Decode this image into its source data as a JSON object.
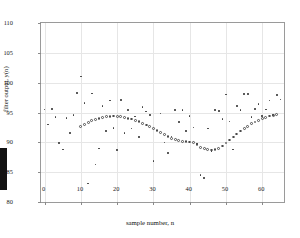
{
  "figure": {
    "background": "#ffffff",
    "frame_color": "#9a9a9a",
    "grid_color": "#e6e6e6",
    "marker_color": "#3a3a3a"
  },
  "axes": {
    "x_title": "sample number, n",
    "y_title": "filter output, y(n)",
    "x_ticks": [
      "0",
      "10",
      "20",
      "30",
      "40",
      "50",
      "60"
    ],
    "y_ticks": [
      "80",
      "85",
      "90",
      "95",
      "100",
      "105",
      "110"
    ]
  },
  "chart_data": {
    "type": "scatter",
    "title": "",
    "xlabel": "sample number, n",
    "ylabel": "filter output, y(n)",
    "xlim": [
      -1,
      66
    ],
    "ylim": [
      80,
      110
    ],
    "xticks": [
      0,
      10,
      20,
      30,
      40,
      50,
      60
    ],
    "yticks": [
      80,
      85,
      90,
      95,
      100,
      105,
      110
    ],
    "grid": true,
    "legend": "none",
    "series": [
      {
        "name": "noisy samples",
        "marker": "dot",
        "x": [
          0,
          1,
          2,
          3,
          4,
          5,
          6,
          7,
          8,
          9,
          10,
          11,
          12,
          13,
          14,
          15,
          16,
          17,
          18,
          19,
          20,
          21,
          22,
          23,
          24,
          25,
          26,
          27,
          28,
          29,
          30,
          31,
          32,
          33,
          34,
          35,
          36,
          37,
          38,
          39,
          40,
          41,
          42,
          43,
          44,
          45,
          46,
          47,
          48,
          49,
          50,
          51,
          52,
          53,
          54,
          55,
          56,
          57,
          58,
          59,
          60,
          61,
          62,
          63,
          64,
          65
        ],
        "y": [
          95.5,
          93.0,
          95.6,
          94.2,
          89.9,
          88.8,
          94.1,
          91.6,
          94.6,
          98.3,
          101.0,
          96.6,
          83.1,
          98.2,
          86.3,
          89.0,
          96.1,
          91.9,
          97.0,
          92.4,
          88.7,
          97.1,
          91.6,
          95.4,
          92.3,
          94.3,
          90.9,
          95.9,
          95.2,
          94.6,
          86.9,
          92.0,
          94.8,
          90.0,
          88.2,
          91.0,
          95.4,
          93.4,
          95.4,
          91.9,
          94.4,
          92.5,
          89.8,
          84.5,
          84.0,
          92.3,
          88.5,
          95.4,
          95.3,
          93.9,
          98.0,
          93.5,
          88.8,
          96.1,
          95.4,
          98.1,
          98.1,
          94.2,
          95.6,
          96.4,
          94.4,
          95.5,
          97.0,
          94.6,
          97.9,
          97.2
        ]
      },
      {
        "name": "filtered output",
        "marker": "circle",
        "x": [
          10,
          11,
          12,
          13,
          14,
          15,
          16,
          17,
          18,
          19,
          20,
          21,
          22,
          23,
          24,
          25,
          26,
          27,
          28,
          29,
          30,
          31,
          32,
          33,
          34,
          35,
          36,
          37,
          38,
          39,
          40,
          41,
          42,
          43,
          44,
          45,
          46,
          47,
          48,
          49,
          50,
          51,
          52,
          53,
          54,
          55,
          56,
          57,
          58,
          59,
          60,
          61,
          62,
          63,
          64
        ],
        "y": [
          92.7,
          93.0,
          93.3,
          93.6,
          93.8,
          94.0,
          94.15,
          94.3,
          94.35,
          94.4,
          94.35,
          94.3,
          94.2,
          94.05,
          93.9,
          93.7,
          93.45,
          93.2,
          92.9,
          92.6,
          92.3,
          92.0,
          91.6,
          91.3,
          91.0,
          90.7,
          90.5,
          90.3,
          90.2,
          90.1,
          90.05,
          90.0,
          89.6,
          89.2,
          88.9,
          88.75,
          88.7,
          88.8,
          89.0,
          89.4,
          89.9,
          90.4,
          90.9,
          91.4,
          91.9,
          92.3,
          92.7,
          93.1,
          93.4,
          93.7,
          94.0,
          94.2,
          94.4,
          94.55,
          94.7
        ]
      }
    ]
  }
}
